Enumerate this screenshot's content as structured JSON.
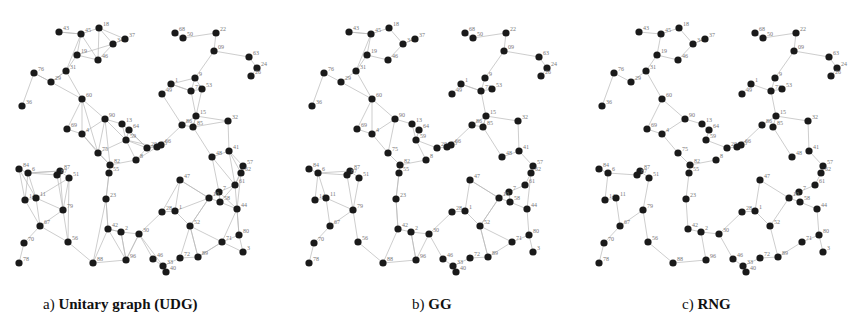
{
  "figure": {
    "panels": [
      {
        "id": "a",
        "prefix": "a)",
        "title": "Unitary graph (UDG)",
        "left": 0
      },
      {
        "id": "b",
        "prefix": "b)",
        "title": "GG",
        "left": 290
      },
      {
        "id": "c",
        "prefix": "c)",
        "title": "RNG",
        "left": 580
      }
    ],
    "colors": {
      "node": "#1a1a1a",
      "edge": "#b8b8b8",
      "label": "#777777",
      "caption": "#111111"
    }
  },
  "nodes": [
    {
      "id": "43",
      "x": 59,
      "y": 32
    },
    {
      "id": "45",
      "x": 81,
      "y": 34
    },
    {
      "id": "18",
      "x": 99,
      "y": 28
    },
    {
      "id": "34",
      "x": 113,
      "y": 44
    },
    {
      "id": "37",
      "x": 125,
      "y": 39
    },
    {
      "id": "19",
      "x": 77,
      "y": 55
    },
    {
      "id": "46",
      "x": 98,
      "y": 60
    },
    {
      "id": "31",
      "x": 66,
      "y": 71
    },
    {
      "id": "76",
      "x": 34,
      "y": 73
    },
    {
      "id": "29",
      "x": 51,
      "y": 82
    },
    {
      "id": "36",
      "x": 22,
      "y": 106
    },
    {
      "id": "60",
      "x": 82,
      "y": 99
    },
    {
      "id": "90",
      "x": 105,
      "y": 119
    },
    {
      "id": "13",
      "x": 122,
      "y": 124
    },
    {
      "id": "64",
      "x": 129,
      "y": 130
    },
    {
      "id": "59",
      "x": 126,
      "y": 140
    },
    {
      "id": "69",
      "x": 67,
      "y": 129
    },
    {
      "id": "4",
      "x": 82,
      "y": 134
    },
    {
      "id": "75",
      "x": 98,
      "y": 153
    },
    {
      "id": "8",
      "x": 136,
      "y": 160
    },
    {
      "id": "82",
      "x": 110,
      "y": 165
    },
    {
      "id": "55",
      "x": 109,
      "y": 173
    },
    {
      "id": "20",
      "x": 147,
      "y": 148
    },
    {
      "id": "65",
      "x": 157,
      "y": 147
    },
    {
      "id": "66",
      "x": 161,
      "y": 145
    },
    {
      "id": "68",
      "x": 175,
      "y": 33
    },
    {
      "id": "50",
      "x": 183,
      "y": 38
    },
    {
      "id": "22",
      "x": 216,
      "y": 33
    },
    {
      "id": "09",
      "x": 214,
      "y": 51
    },
    {
      "id": "63",
      "x": 249,
      "y": 57
    },
    {
      "id": "24",
      "x": 257,
      "y": 68
    },
    {
      "id": "26",
      "x": 251,
      "y": 76
    },
    {
      "id": "9",
      "x": 195,
      "y": 78
    },
    {
      "id": "1",
      "x": 171,
      "y": 84
    },
    {
      "id": "49",
      "x": 162,
      "y": 94
    },
    {
      "id": "73",
      "x": 191,
      "y": 91
    },
    {
      "id": "53",
      "x": 202,
      "y": 89
    },
    {
      "id": "15",
      "x": 196,
      "y": 116
    },
    {
      "id": "86",
      "x": 182,
      "y": 125
    },
    {
      "id": "85",
      "x": 193,
      "y": 127
    },
    {
      "id": "32",
      "x": 228,
      "y": 121
    },
    {
      "id": "48",
      "x": 212,
      "y": 157
    },
    {
      "id": "41",
      "x": 229,
      "y": 151
    },
    {
      "id": "57",
      "x": 243,
      "y": 166
    },
    {
      "id": "62",
      "x": 241,
      "y": 173
    },
    {
      "id": "61",
      "x": 235,
      "y": 185
    },
    {
      "id": "7",
      "x": 219,
      "y": 192
    },
    {
      "id": "10",
      "x": 209,
      "y": 198
    },
    {
      "id": "58",
      "x": 220,
      "y": 202
    },
    {
      "id": "44",
      "x": 237,
      "y": 209
    },
    {
      "id": "47",
      "x": 180,
      "y": 180
    },
    {
      "id": "28",
      "x": 162,
      "y": 212
    },
    {
      "id": "1b",
      "x": 175,
      "y": 211
    },
    {
      "id": "52",
      "x": 190,
      "y": 226
    },
    {
      "id": "71",
      "x": 222,
      "y": 242
    },
    {
      "id": "80",
      "x": 239,
      "y": 235
    },
    {
      "id": "3",
      "x": 243,
      "y": 252
    },
    {
      "id": "72",
      "x": 180,
      "y": 258
    },
    {
      "id": "89",
      "x": 198,
      "y": 257
    },
    {
      "id": "46b",
      "x": 153,
      "y": 259
    },
    {
      "id": "33",
      "x": 163,
      "y": 266
    },
    {
      "id": "40",
      "x": 166,
      "y": 272
    },
    {
      "id": "30",
      "x": 139,
      "y": 234
    },
    {
      "id": "2",
      "x": 121,
      "y": 232
    },
    {
      "id": "42",
      "x": 108,
      "y": 229
    },
    {
      "id": "96",
      "x": 126,
      "y": 260
    },
    {
      "id": "88",
      "x": 93,
      "y": 263
    },
    {
      "id": "23",
      "x": 106,
      "y": 199
    },
    {
      "id": "84",
      "x": 19,
      "y": 169
    },
    {
      "id": "6",
      "x": 28,
      "y": 173
    },
    {
      "id": "87",
      "x": 60,
      "y": 171
    },
    {
      "id": "87b",
      "x": 57,
      "y": 175
    },
    {
      "id": "51",
      "x": 69,
      "y": 178
    },
    {
      "id": "14",
      "x": 25,
      "y": 200
    },
    {
      "id": "11",
      "x": 36,
      "y": 198
    },
    {
      "id": "79",
      "x": 63,
      "y": 210
    },
    {
      "id": "67",
      "x": 40,
      "y": 226
    },
    {
      "id": "70",
      "x": 24,
      "y": 243
    },
    {
      "id": "78",
      "x": 19,
      "y": 263
    },
    {
      "id": "56",
      "x": 68,
      "y": 242
    }
  ],
  "edges": {
    "rng": [
      [
        "43",
        "45"
      ],
      [
        "45",
        "18"
      ],
      [
        "18",
        "34"
      ],
      [
        "34",
        "37"
      ],
      [
        "34",
        "46"
      ],
      [
        "46",
        "19"
      ],
      [
        "19",
        "45"
      ],
      [
        "19",
        "31"
      ],
      [
        "31",
        "60"
      ],
      [
        "76",
        "29"
      ],
      [
        "29",
        "31"
      ],
      [
        "76",
        "36"
      ],
      [
        "60",
        "90"
      ],
      [
        "60",
        "69"
      ],
      [
        "69",
        "4"
      ],
      [
        "4",
        "90"
      ],
      [
        "4",
        "75"
      ],
      [
        "75",
        "82"
      ],
      [
        "82",
        "55"
      ],
      [
        "90",
        "13"
      ],
      [
        "13",
        "64"
      ],
      [
        "64",
        "59"
      ],
      [
        "59",
        "20"
      ],
      [
        "20",
        "65"
      ],
      [
        "65",
        "66"
      ],
      [
        "82",
        "8"
      ],
      [
        "66",
        "86"
      ],
      [
        "86",
        "15"
      ],
      [
        "15",
        "85"
      ],
      [
        "15",
        "73"
      ],
      [
        "73",
        "53"
      ],
      [
        "73",
        "9"
      ],
      [
        "9",
        "09"
      ],
      [
        "09",
        "22"
      ],
      [
        "22",
        "50"
      ],
      [
        "50",
        "68"
      ],
      [
        "09",
        "63"
      ],
      [
        "63",
        "24"
      ],
      [
        "24",
        "26"
      ],
      [
        "73",
        "1"
      ],
      [
        "1",
        "49"
      ],
      [
        "15",
        "32"
      ],
      [
        "32",
        "41"
      ],
      [
        "85",
        "48"
      ],
      [
        "41",
        "57"
      ],
      [
        "57",
        "62"
      ],
      [
        "62",
        "61"
      ],
      [
        "61",
        "7"
      ],
      [
        "7",
        "10"
      ],
      [
        "10",
        "58"
      ],
      [
        "58",
        "44"
      ],
      [
        "44",
        "80"
      ],
      [
        "80",
        "3"
      ],
      [
        "10",
        "47"
      ],
      [
        "10",
        "52"
      ],
      [
        "47",
        "1b"
      ],
      [
        "1b",
        "28"
      ],
      [
        "28",
        "30"
      ],
      [
        "30",
        "2"
      ],
      [
        "2",
        "42"
      ],
      [
        "42",
        "23"
      ],
      [
        "23",
        "55"
      ],
      [
        "2",
        "96"
      ],
      [
        "96",
        "88"
      ],
      [
        "30",
        "46b"
      ],
      [
        "46b",
        "33"
      ],
      [
        "33",
        "40"
      ],
      [
        "33",
        "72"
      ],
      [
        "72",
        "89"
      ],
      [
        "89",
        "52"
      ],
      [
        "89",
        "71"
      ],
      [
        "71",
        "80"
      ],
      [
        "84",
        "6"
      ],
      [
        "6",
        "87b"
      ],
      [
        "87b",
        "87"
      ],
      [
        "87",
        "51"
      ],
      [
        "6",
        "14"
      ],
      [
        "14",
        "11"
      ],
      [
        "11",
        "67"
      ],
      [
        "67",
        "79"
      ],
      [
        "79",
        "51"
      ],
      [
        "79",
        "56"
      ],
      [
        "56",
        "88"
      ],
      [
        "67",
        "70"
      ],
      [
        "70",
        "78"
      ],
      [
        "1b",
        "52"
      ]
    ],
    "gg_extra": [
      [
        "43",
        "45"
      ],
      [
        "29",
        "60"
      ],
      [
        "31",
        "45"
      ],
      [
        "90",
        "75"
      ],
      [
        "59",
        "8"
      ],
      [
        "13",
        "59"
      ],
      [
        "60",
        "4"
      ],
      [
        "86",
        "85"
      ],
      [
        "1",
        "73"
      ],
      [
        "15",
        "85"
      ],
      [
        "48",
        "41"
      ],
      [
        "47",
        "10"
      ],
      [
        "52",
        "71"
      ],
      [
        "30",
        "96"
      ],
      [
        "2",
        "96"
      ],
      [
        "42",
        "88"
      ],
      [
        "11",
        "79"
      ],
      [
        "6",
        "11"
      ],
      [
        "87",
        "6"
      ],
      [
        "79",
        "87b"
      ],
      [
        "62",
        "44"
      ],
      [
        "7",
        "58"
      ],
      [
        "10",
        "52"
      ],
      [
        "89",
        "52"
      ],
      [
        "23",
        "42"
      ],
      [
        "82",
        "23"
      ]
    ],
    "udg_extra": [
      [
        "45",
        "46"
      ],
      [
        "18",
        "46"
      ],
      [
        "18",
        "37"
      ],
      [
        "19",
        "34"
      ],
      [
        "29",
        "76"
      ],
      [
        "31",
        "29"
      ],
      [
        "60",
        "75"
      ],
      [
        "90",
        "59"
      ],
      [
        "90",
        "82"
      ],
      [
        "13",
        "20"
      ],
      [
        "64",
        "20"
      ],
      [
        "59",
        "65"
      ],
      [
        "8",
        "65"
      ],
      [
        "20",
        "66"
      ],
      [
        "8",
        "20"
      ],
      [
        "4",
        "82"
      ],
      [
        "75",
        "59"
      ],
      [
        "86",
        "49"
      ],
      [
        "85",
        "32"
      ],
      [
        "15",
        "53"
      ],
      [
        "9",
        "53"
      ],
      [
        "9",
        "1"
      ],
      [
        "41",
        "61"
      ],
      [
        "48",
        "61"
      ],
      [
        "48",
        "7"
      ],
      [
        "57",
        "61"
      ],
      [
        "41",
        "62"
      ],
      [
        "61",
        "44"
      ],
      [
        "7",
        "44"
      ],
      [
        "58",
        "61"
      ],
      [
        "44",
        "71"
      ],
      [
        "80",
        "44"
      ],
      [
        "47",
        "28"
      ],
      [
        "1b",
        "10"
      ],
      [
        "52",
        "72"
      ],
      [
        "30",
        "33"
      ],
      [
        "96",
        "30"
      ],
      [
        "42",
        "96"
      ],
      [
        "84",
        "14"
      ],
      [
        "84",
        "11"
      ],
      [
        "6",
        "87"
      ],
      [
        "14",
        "67"
      ],
      [
        "11",
        "51"
      ],
      [
        "79",
        "87"
      ],
      [
        "67",
        "56"
      ],
      [
        "51",
        "56"
      ],
      [
        "88",
        "23"
      ],
      [
        "42",
        "2"
      ],
      [
        "89",
        "71"
      ],
      [
        "3",
        "71"
      ]
    ]
  }
}
